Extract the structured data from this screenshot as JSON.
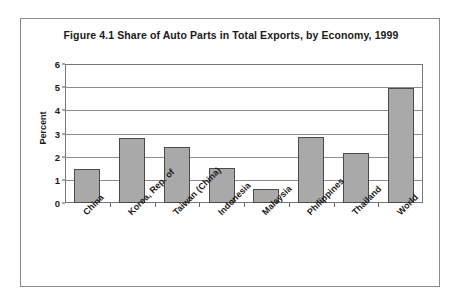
{
  "figure": {
    "title": "Figure 4.1 Share of Auto Parts in Total Exports, by Economy, 1999",
    "frame_color": "#8a8a8a",
    "background": "#ffffff"
  },
  "chart_data": {
    "type": "bar",
    "title": "Figure 4.1 Share of Auto Parts in Total Exports, by Economy, 1999",
    "xlabel": "",
    "ylabel": "Percent",
    "categories": [
      "China",
      "Korea, Rep. of",
      "Taiwan (China)",
      "Indonesia",
      "Malaysia",
      "Philippines",
      "Thailand",
      "World"
    ],
    "values": [
      1.45,
      2.8,
      2.4,
      1.5,
      0.62,
      2.85,
      2.18,
      4.95
    ],
    "ylim": [
      0,
      6
    ],
    "yticks": [
      0,
      1,
      2,
      3,
      4,
      5,
      6
    ],
    "ytick_labels": [
      "0",
      "1",
      "2",
      "3",
      "4",
      "5",
      "6"
    ],
    "grid": true,
    "grid_axis": "y",
    "legend": false,
    "bar_fill": "#a9a9a9",
    "bar_edge": "#4a4a4a",
    "label_rotation": -45
  }
}
